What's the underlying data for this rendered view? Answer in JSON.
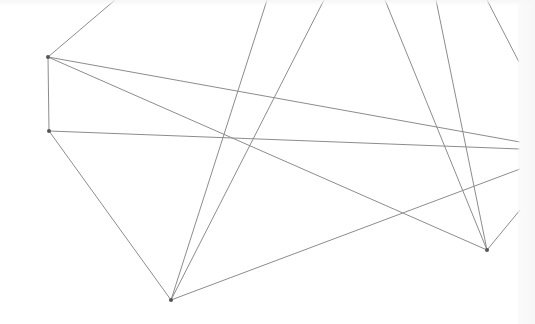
{
  "diagram": {
    "type": "network-graph",
    "background": "#ffffff",
    "edge_color": "#8c8c8c",
    "node_color": "#555555",
    "edge_width": 1,
    "node_radius": 2,
    "nodes": [
      {
        "id": "A",
        "x": 48,
        "y": 57
      },
      {
        "id": "B",
        "x": 49,
        "y": 131
      },
      {
        "id": "C",
        "x": 171,
        "y": 300
      },
      {
        "id": "D",
        "x": 487,
        "y": 250
      }
    ],
    "edges": [
      {
        "x1": 48,
        "y1": 57,
        "x2": 115,
        "y2": 0
      },
      {
        "x1": 48,
        "y1": 57,
        "x2": 49,
        "y2": 131
      },
      {
        "x1": 48,
        "y1": 57,
        "x2": 520,
        "y2": 142
      },
      {
        "x1": 48,
        "y1": 57,
        "x2": 487,
        "y2": 250
      },
      {
        "x1": 49,
        "y1": 131,
        "x2": 520,
        "y2": 149
      },
      {
        "x1": 49,
        "y1": 131,
        "x2": 171,
        "y2": 300
      },
      {
        "x1": 171,
        "y1": 300,
        "x2": 267,
        "y2": 0
      },
      {
        "x1": 171,
        "y1": 300,
        "x2": 324,
        "y2": 0
      },
      {
        "x1": 171,
        "y1": 300,
        "x2": 520,
        "y2": 169
      },
      {
        "x1": 487,
        "y1": 250,
        "x2": 385,
        "y2": 0
      },
      {
        "x1": 487,
        "y1": 250,
        "x2": 436,
        "y2": 0
      },
      {
        "x1": 487,
        "y1": 250,
        "x2": 520,
        "y2": 210
      },
      {
        "x1": 487,
        "y1": 0,
        "x2": 519,
        "y2": 62
      }
    ]
  }
}
